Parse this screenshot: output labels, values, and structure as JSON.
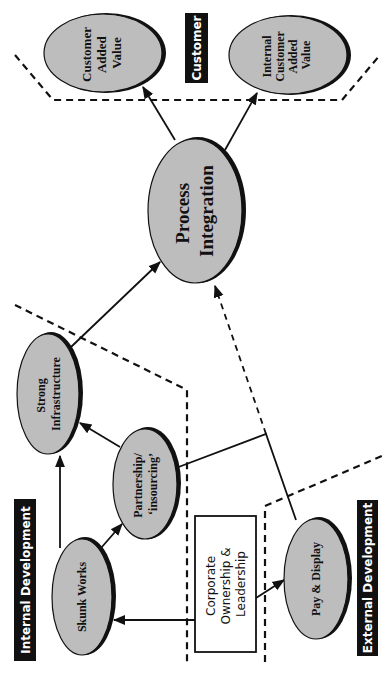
{
  "diagram": {
    "orientation": "rotated 90° counter-clockwise",
    "zones": {
      "customer": {
        "label": "Customer"
      },
      "internal": {
        "label": "Internal Development"
      },
      "external": {
        "label": "External Development"
      }
    },
    "nodes": {
      "customer_added_value": {
        "lines": [
          "Customer",
          "Added",
          "Value"
        ]
      },
      "internal_customer_added_value": {
        "lines": [
          "Internal",
          "Customer",
          "Added",
          "Value"
        ]
      },
      "process_integration": {
        "lines": [
          "Process",
          "Integration"
        ]
      },
      "strong_infrastructure": {
        "lines": [
          "Strong",
          "Infrastructure"
        ]
      },
      "partnership": {
        "lines": [
          "Partnership/",
          "‘insourcing’"
        ]
      },
      "skunk_works": {
        "lines": [
          "Skunk Works"
        ]
      },
      "pay_display": {
        "lines": [
          "Pay & Display"
        ]
      },
      "corporate": {
        "lines": [
          "Corporate",
          "Ownership &",
          "Leadership"
        ]
      }
    },
    "edges": [
      {
        "from": "Process Integration",
        "to": "Customer Added Value",
        "style": "solid-arrow"
      },
      {
        "from": "Process Integration",
        "to": "Internal Customer Added Value",
        "style": "solid-arrow"
      },
      {
        "from": "Strong Infrastructure",
        "to": "Process Integration",
        "style": "solid-arrow"
      },
      {
        "from": "Skunk Works",
        "to": "Strong Infrastructure",
        "style": "solid-arrow"
      },
      {
        "from": "Skunk Works",
        "to": "Partnership/‘insourcing’",
        "style": "solid-arrow"
      },
      {
        "from": "Partnership/‘insourcing’",
        "to": "Strong Infrastructure",
        "style": "solid-arrow"
      },
      {
        "from": "Corporate Ownership & Leadership",
        "to": "Skunk Works",
        "style": "solid-arrow"
      },
      {
        "from": "Corporate Ownership & Leadership",
        "to": "Pay & Display",
        "style": "solid-arrow"
      },
      {
        "from": "Pay & Display",
        "to": "Partnership/‘insourcing’",
        "style": "solid-line"
      },
      {
        "from": "Pay & Display",
        "to": "Process Integration",
        "style": "dashed-arrow"
      }
    ],
    "colors": {
      "oval_fill": "#bdbdbd",
      "label_bg": "#111111",
      "label_text": "#ffffff",
      "line": "#111111"
    }
  }
}
